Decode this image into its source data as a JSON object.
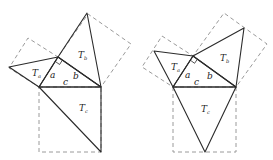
{
  "figures": [
    {
      "id": "left",
      "variant": "triangles on outer square side (full)",
      "vertices": {
        "right_angle": [
          58,
          57
        ],
        "A": [
          39,
          87
        ],
        "B": [
          101,
          87
        ],
        "Ta_apex": [
          9,
          67
        ],
        "Tb_apex": [
          87,
          13
        ],
        "Tc_apex": [
          101,
          152
        ]
      },
      "squares": {
        "a": [
          [
            39,
            87
          ],
          [
            58,
            57
          ],
          [
            28,
            38
          ],
          [
            9,
            68
          ]
        ],
        "b": [
          [
            58,
            57
          ],
          [
            101,
            87
          ],
          [
            131,
            44
          ],
          [
            88,
            14
          ]
        ],
        "c": [
          [
            39,
            87
          ],
          [
            101,
            87
          ],
          [
            101,
            152
          ],
          [
            39,
            152
          ]
        ]
      },
      "labels": {
        "Ta": {
          "main": "T",
          "sub": "a",
          "pos": [
            32,
            76
          ]
        },
        "Tb": {
          "main": "T",
          "sub": "b",
          "pos": [
            78,
            58
          ]
        },
        "Tc": {
          "main": "T",
          "sub": "c",
          "pos": [
            79,
            111
          ]
        },
        "a": {
          "text": "a",
          "pos": [
            50,
            78
          ]
        },
        "b": {
          "text": "b",
          "pos": [
            73,
            79
          ]
        },
        "c": {
          "text": "c",
          "pos": [
            63,
            85
          ]
        }
      }
    },
    {
      "id": "right",
      "variant": "triangles with apex at square side midpoint",
      "vertices": {
        "right_angle": [
          193,
          56
        ],
        "A": [
          173,
          87
        ],
        "B": [
          236,
          87
        ],
        "Ta_apex": [
          154,
          51
        ],
        "Tb_apex": [
          244,
          28
        ],
        "Tc_apex": [
          205,
          152
        ]
      },
      "squares": {
        "a": [
          [
            173,
            87
          ],
          [
            193,
            56
          ],
          [
            162,
            36
          ],
          [
            142,
            67
          ]
        ],
        "b": [
          [
            193,
            56
          ],
          [
            236,
            87
          ],
          [
            267,
            44
          ],
          [
            224,
            13
          ]
        ],
        "c": [
          [
            173,
            87
          ],
          [
            236,
            87
          ],
          [
            236,
            152
          ],
          [
            173,
            152
          ]
        ]
      },
      "labels": {
        "Ta": {
          "main": "T",
          "sub": "a",
          "pos": [
            171,
            70
          ]
        },
        "Tb": {
          "main": "T",
          "sub": "b",
          "pos": [
            220,
            61
          ]
        },
        "Tc": {
          "main": "T",
          "sub": "c",
          "pos": [
            201,
            112
          ]
        },
        "a": {
          "text": "a",
          "pos": [
            185,
            78
          ]
        },
        "b": {
          "text": "b",
          "pos": [
            207,
            79
          ]
        },
        "c": {
          "text": "c",
          "pos": [
            194,
            85
          ]
        }
      }
    }
  ],
  "colors": {
    "solid": "#2b2b2b",
    "dashed": "#9a9a9a",
    "background": "#ffffff"
  }
}
